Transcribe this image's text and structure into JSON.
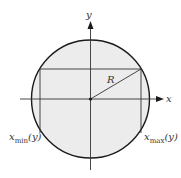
{
  "diagram": {
    "title": "",
    "axes": {
      "x_label": "x",
      "y_label": "y"
    },
    "radius_label": "R",
    "x_min_label": {
      "base": "x",
      "sub": "min",
      "arg": "(y)"
    },
    "x_max_label": {
      "base": "x",
      "sub": "max",
      "arg": "(y)"
    },
    "colors": {
      "fill": "#ececec",
      "stroke": "#1a1a1a",
      "axis": "#333333"
    },
    "geometry": {
      "center": [
        90.5,
        99
      ],
      "radius": 59,
      "chord_y": 69,
      "x_min_line_x": 40,
      "x_max_line_x": 141
    }
  }
}
